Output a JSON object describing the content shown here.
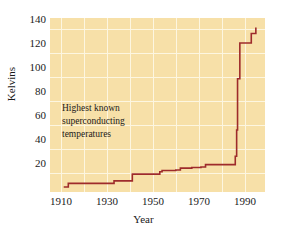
{
  "chart_data": {
    "type": "line",
    "title": "",
    "annotation": {
      "line1": "Highest known",
      "line2": "superconducting",
      "line3": "temperatures"
    },
    "xlabel": "Year",
    "ylabel": "Kelvins",
    "xlim": [
      1905,
      1999
    ],
    "ylim": [
      0,
      146
    ],
    "grid": true,
    "legend": false,
    "x_ticks": [
      1910,
      1930,
      1950,
      1970,
      1990
    ],
    "x_tick_labels": [
      "1910",
      "1930",
      "1950",
      "1970",
      "1990"
    ],
    "x_minor_step": 10,
    "y_ticks": [
      20,
      40,
      60,
      80,
      100,
      120,
      140
    ],
    "y_tick_labels": [
      "20",
      "40",
      "60",
      "80",
      "100",
      "120",
      "140"
    ],
    "line_color": "#9e2b2b",
    "plot_background": "#f7e0a8",
    "grid_color": "#fdf6e0",
    "step_style": "post",
    "series": [
      {
        "name": "Highest known superconducting temperature",
        "x": [
          1911,
          1913,
          1930,
          1933,
          1941,
          1953,
          1954,
          1960,
          1962,
          1967,
          1971,
          1973,
          1986,
          1986.6,
          1987,
          1988,
          1993,
          1995
        ],
        "y": [
          4.2,
          7.2,
          7.2,
          9.3,
          15,
          17,
          18,
          18.5,
          20,
          20.5,
          21,
          23,
          30,
          52,
          95,
          125,
          133,
          138
        ],
        "units": "K"
      }
    ]
  }
}
